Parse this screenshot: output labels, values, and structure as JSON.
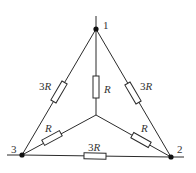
{
  "diagram": {
    "type": "resistor-network",
    "nodes": [
      {
        "id": "1",
        "label": "1"
      },
      {
        "id": "2",
        "label": "2"
      },
      {
        "id": "3",
        "label": "3"
      },
      {
        "id": "center",
        "label": ""
      }
    ],
    "resistors": [
      {
        "id": "r13",
        "between": [
          "1",
          "3"
        ],
        "label_num": "3",
        "label_var": "R"
      },
      {
        "id": "r12",
        "between": [
          "1",
          "2"
        ],
        "label_num": "3",
        "label_var": "R"
      },
      {
        "id": "r32",
        "between": [
          "3",
          "2"
        ],
        "label_num": "3",
        "label_var": "R"
      },
      {
        "id": "r1c",
        "between": [
          "1",
          "center"
        ],
        "label_num": "",
        "label_var": "R"
      },
      {
        "id": "r3c",
        "between": [
          "3",
          "center"
        ],
        "label_num": "",
        "label_var": "R"
      },
      {
        "id": "r2c",
        "between": [
          "2",
          "center"
        ],
        "label_num": "",
        "label_var": "R"
      }
    ]
  }
}
